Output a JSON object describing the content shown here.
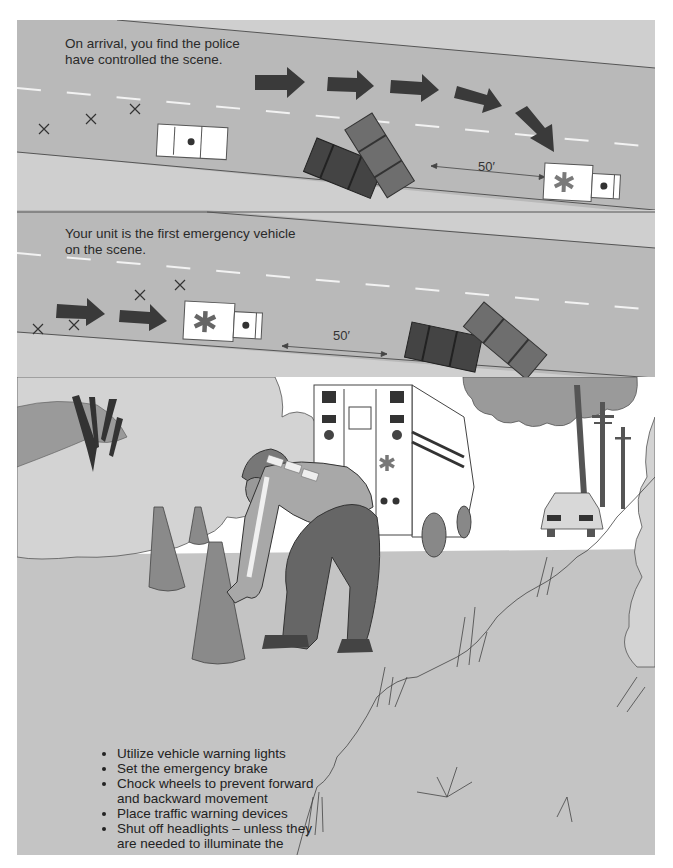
{
  "figure": {
    "panels": [
      {
        "id": "panel-1",
        "caption": "On arrival, you find the police have controlled the scene.",
        "distance_label": "50′",
        "elements": [
          "road",
          "lane-dashes",
          "hazard-x-markers x3",
          "police-car",
          "two-crashed-cars",
          "path-arrows x5",
          "ambulance"
        ]
      },
      {
        "id": "panel-2",
        "caption": "Your unit is the first emergency vehicle on the scene.",
        "distance_label": "50′",
        "elements": [
          "road",
          "lane-dashes",
          "hazard-x-markers x4",
          "path-arrows x2",
          "ambulance",
          "two-crashed-cars"
        ]
      },
      {
        "id": "panel-3",
        "description": "EMT placing traffic cones behind a parked ambulance on a roadside; crashed car against utility pole in background",
        "bullets": [
          "Utilize vehicle warning lights",
          "Set the emergency brake",
          "Chock wheels to prevent forward and backward movement",
          "Place traffic warning devices",
          "Shut off headlights – unless they are needed to illuminate the scene."
        ]
      }
    ]
  },
  "colors": {
    "road": "#b9b9b9",
    "shoulder": "#cfcfcf",
    "arrow": "#3a3a3a",
    "car_dark": "#444444",
    "car_mid": "#6e6e6e",
    "vehicle_white": "#ffffff",
    "star": "#7a7a7a",
    "sky": "#ffffff",
    "cloud": "#9a9a9a",
    "bush": "#d3d3d3",
    "ground": "#c4c4c4",
    "cone": "#8a8a8a"
  }
}
